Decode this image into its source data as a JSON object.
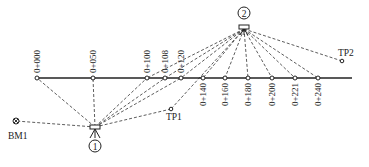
{
  "diagram": {
    "route_line": {
      "x1": 37,
      "x2": 352,
      "y": 78
    },
    "stations": [
      {
        "label": "0+000",
        "x": 37,
        "side": "above"
      },
      {
        "label": "0+050",
        "x": 93,
        "side": "above"
      },
      {
        "label": "0+100",
        "x": 147,
        "side": "above"
      },
      {
        "label": "0+108",
        "x": 165,
        "side": "above"
      },
      {
        "label": "0+120",
        "x": 181,
        "side": "above"
      },
      {
        "label": "0+140",
        "x": 203,
        "side": "below"
      },
      {
        "label": "0+160",
        "x": 225,
        "side": "below"
      },
      {
        "label": "0+180",
        "x": 248,
        "side": "below"
      },
      {
        "label": "0+200",
        "x": 272,
        "side": "below"
      },
      {
        "label": "0+221",
        "x": 295,
        "side": "below"
      },
      {
        "label": "0+240",
        "x": 318,
        "side": "below"
      }
    ],
    "instruments": [
      {
        "id": "1",
        "label": "1",
        "x": 95,
        "y": 127,
        "circle_y": 146
      },
      {
        "id": "2",
        "label": "2",
        "x": 244,
        "y": 27,
        "circle_y": 13
      }
    ],
    "points": {
      "bm1": {
        "label": "BM1",
        "x": 16,
        "y": 121
      },
      "tp1": {
        "label": "TP1",
        "x": 171,
        "y": 109
      },
      "tp2": {
        "label": "TP2",
        "x": 342,
        "y": 61
      }
    },
    "sights": {
      "instrument_1": [
        "BM1",
        "0+000",
        "0+050",
        "0+100",
        "0+108",
        "0+120",
        "TP1"
      ],
      "instrument_2": [
        "TP1",
        "0+100",
        "0+108",
        "0+120",
        "0+140",
        "0+160",
        "0+180",
        "0+200",
        "0+221",
        "0+240",
        "TP2"
      ]
    }
  }
}
